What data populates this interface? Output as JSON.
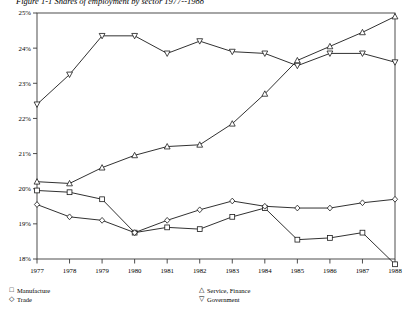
{
  "figure": {
    "title": "Figure 1-1  Shares of employment by sector 1977--1988"
  },
  "chart_data": {
    "type": "line",
    "title": "Figure 1-1  Shares of employment by sector 1977--1988",
    "xlabel": "",
    "ylabel": "",
    "x": [
      "1977",
      "1978",
      "1979",
      "1980",
      "1981",
      "1982",
      "1983",
      "1984",
      "1985",
      "1986",
      "1987",
      "1988"
    ],
    "xlim": [
      "1977",
      "1988"
    ],
    "ylim": [
      18,
      25
    ],
    "yticks": [
      "18%",
      "19%",
      "20%",
      "21%",
      "22%",
      "23%",
      "24%",
      "25%"
    ],
    "ytick_values": [
      18,
      19,
      20,
      21,
      22,
      23,
      24,
      25
    ],
    "grid": false,
    "legend_position": "below-axes",
    "series": [
      {
        "name": "Manufacture",
        "marker": "square",
        "values": [
          19.95,
          19.9,
          19.7,
          18.75,
          18.9,
          18.85,
          19.2,
          19.45,
          18.55,
          18.6,
          18.75,
          17.85
        ]
      },
      {
        "name": "Trade",
        "marker": "diamond",
        "values": [
          19.55,
          19.2,
          19.1,
          18.75,
          19.1,
          19.4,
          19.65,
          19.5,
          19.45,
          19.45,
          19.6,
          19.7
        ]
      },
      {
        "name": "Service, Finance",
        "marker": "triangle-up",
        "values": [
          20.2,
          20.15,
          20.6,
          20.95,
          21.2,
          21.25,
          21.85,
          22.7,
          23.65,
          24.05,
          24.45,
          24.9
        ]
      },
      {
        "name": "Government",
        "marker": "triangle-down",
        "values": [
          22.4,
          23.25,
          24.35,
          24.35,
          23.85,
          24.2,
          23.9,
          23.85,
          23.5,
          23.85,
          23.85,
          23.6
        ]
      }
    ]
  },
  "yaxis": {
    "labels": [
      "25%",
      "24%",
      "23%",
      "22%",
      "21%",
      "20%",
      "19%",
      "18%"
    ]
  },
  "xaxis": {
    "labels": [
      "1977",
      "1978",
      "1979",
      "1980",
      "1981",
      "1982",
      "1983",
      "1984",
      "1985",
      "1986",
      "1987",
      "1988"
    ]
  },
  "legend": {
    "left": [
      {
        "marker": "□",
        "label": "Manufacture"
      },
      {
        "marker": "◇",
        "label": "Trade"
      }
    ],
    "right": [
      {
        "marker": "△",
        "label": "Service, Finance"
      },
      {
        "marker": "▽",
        "label": "Government"
      }
    ]
  },
  "colors": {
    "line": "#1a1a1a",
    "axis": "#3a3a3a",
    "background": "#ffffff"
  }
}
